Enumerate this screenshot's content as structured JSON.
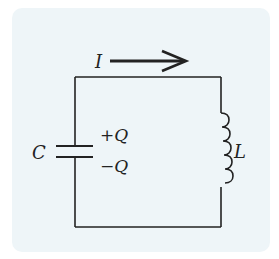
{
  "diagram": {
    "type": "circuit",
    "current_label": "I",
    "capacitor_label": "C",
    "plus_charge_label": "+Q",
    "minus_charge_label": "−Q",
    "inductor_label": "L",
    "components": [
      {
        "kind": "capacitor",
        "label": "C",
        "side": "left"
      },
      {
        "kind": "inductor",
        "label": "L",
        "side": "right",
        "coils": 5
      }
    ],
    "current_direction": "right",
    "colors": {
      "background_card": "#eef5f8",
      "stroke": "#222222"
    }
  }
}
